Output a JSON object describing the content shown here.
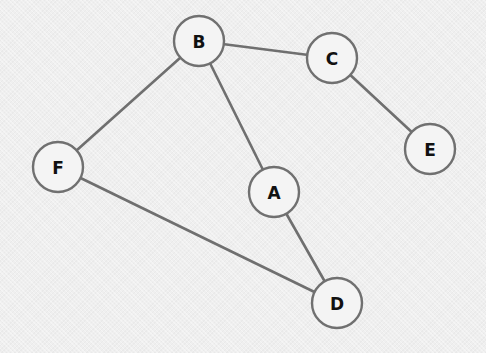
{
  "graph": {
    "nodes": [
      {
        "id": "B",
        "label": "B",
        "x": 199,
        "y": 41
      },
      {
        "id": "C",
        "label": "C",
        "x": 332,
        "y": 58
      },
      {
        "id": "E",
        "label": "E",
        "x": 430,
        "y": 149
      },
      {
        "id": "F",
        "label": "F",
        "x": 58,
        "y": 167
      },
      {
        "id": "A",
        "label": "A",
        "x": 274,
        "y": 192
      },
      {
        "id": "D",
        "label": "D",
        "x": 337,
        "y": 303
      }
    ],
    "edges": [
      {
        "from": "B",
        "to": "C"
      },
      {
        "from": "C",
        "to": "E"
      },
      {
        "from": "B",
        "to": "F"
      },
      {
        "from": "B",
        "to": "A"
      },
      {
        "from": "A",
        "to": "D"
      },
      {
        "from": "F",
        "to": "D"
      }
    ],
    "node_radius": 25
  }
}
